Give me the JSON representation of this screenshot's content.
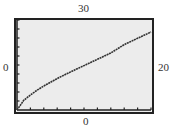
{
  "window": {
    "ymax_label": "30",
    "ymin_label": "0",
    "xmin_label": "0",
    "xmax_label": "20"
  },
  "colors": {
    "plot_background": "#ececec",
    "frame": "#222222",
    "curve": "#333333"
  },
  "chart_data": {
    "type": "line",
    "title": "",
    "xlabel": "",
    "ylabel": "",
    "xlim": [
      0,
      20
    ],
    "ylim": [
      0,
      30
    ],
    "x_ticks_step": 2,
    "y_ticks_step": 3,
    "grid": false,
    "legend": null,
    "annotations": [
      "Window labels: Xmin=0 (left), Xmax=20 (right), Ymin=0 (bottom), Ymax=30 (top)"
    ],
    "series": [
      {
        "name": "curve",
        "x": [
          0,
          1,
          2,
          3,
          4,
          6,
          8,
          10,
          12,
          14,
          16,
          18,
          20
        ],
        "y": [
          0,
          3.2,
          5.0,
          6.6,
          8.0,
          10.5,
          12.7,
          14.8,
          16.9,
          19.0,
          21.8,
          23.9,
          26.0
        ]
      }
    ]
  }
}
